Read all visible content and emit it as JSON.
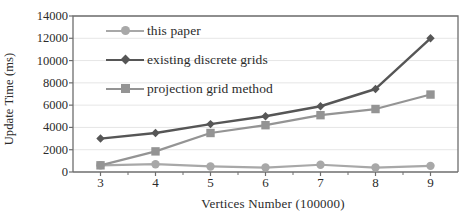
{
  "chart_data": {
    "type": "line",
    "title": "",
    "xlabel": "Vertices Number (100000)",
    "ylabel": "Update Time (ms)",
    "x": [
      3,
      4,
      5,
      6,
      7,
      8,
      9
    ],
    "xtick_labels": [
      "3",
      "4",
      "5",
      "6",
      "7",
      "8",
      "9"
    ],
    "ytick_labels": [
      "0",
      "2000",
      "4000",
      "6000",
      "8000",
      "10000",
      "12000",
      "14000"
    ],
    "yticks": [
      0,
      2000,
      4000,
      6000,
      8000,
      10000,
      12000,
      14000
    ],
    "xlim": [
      2.5,
      9.5
    ],
    "ylim": [
      0,
      14000
    ],
    "grid": "horizontal",
    "legend_position": "upper-left-inside",
    "series": [
      {
        "name": "this paper",
        "marker": "circle",
        "color": "#a8a8a8",
        "values": [
          600,
          700,
          500,
          400,
          650,
          400,
          550
        ]
      },
      {
        "name": "existing discrete grids",
        "marker": "diamond",
        "color": "#565656",
        "values": [
          3000,
          3500,
          4300,
          5000,
          5900,
          7450,
          12000
        ]
      },
      {
        "name": "projection grid method",
        "marker": "square",
        "color": "#949494",
        "values": [
          600,
          1850,
          3500,
          4200,
          5100,
          5650,
          6950
        ]
      }
    ]
  },
  "legend": {
    "items": [
      {
        "label": "this paper"
      },
      {
        "label": "existing discrete grids"
      },
      {
        "label": "projection grid method"
      }
    ]
  },
  "colors": {
    "axis": "#6e6e6e",
    "grid": "#e6e6e6",
    "text": "#2b2b2b",
    "background": "#ffffff"
  }
}
